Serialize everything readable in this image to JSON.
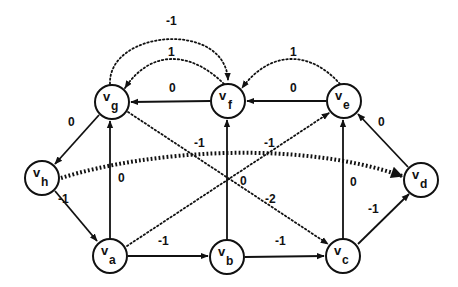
{
  "diagram": {
    "type": "directed-weighted-graph",
    "nodes": [
      {
        "id": "g",
        "label": "v",
        "sub": "g",
        "x": 112,
        "y": 102
      },
      {
        "id": "f",
        "label": "v",
        "sub": "f",
        "x": 228,
        "y": 101
      },
      {
        "id": "e",
        "label": "v",
        "sub": "e",
        "x": 344,
        "y": 101
      },
      {
        "id": "h",
        "label": "v",
        "sub": "h",
        "x": 42,
        "y": 178
      },
      {
        "id": "d",
        "label": "v",
        "sub": "d",
        "x": 421,
        "y": 180
      },
      {
        "id": "a",
        "label": "v",
        "sub": "a",
        "x": 110,
        "y": 256
      },
      {
        "id": "b",
        "label": "v",
        "sub": "b",
        "x": 227,
        "y": 257
      },
      {
        "id": "c",
        "label": "v",
        "sub": "c",
        "x": 343,
        "y": 256
      }
    ],
    "edges": [
      {
        "from": "f",
        "to": "g",
        "weight": "0",
        "style": "solid"
      },
      {
        "from": "e",
        "to": "f",
        "weight": "0",
        "style": "solid"
      },
      {
        "from": "d",
        "to": "e",
        "weight": "0",
        "style": "solid"
      },
      {
        "from": "g",
        "to": "h",
        "weight": "0",
        "style": "solid"
      },
      {
        "from": "h",
        "to": "a",
        "weight": "-1",
        "style": "solid"
      },
      {
        "from": "a",
        "to": "g",
        "weight": "0",
        "style": "solid"
      },
      {
        "from": "a",
        "to": "b",
        "weight": "-1",
        "style": "solid"
      },
      {
        "from": "b",
        "to": "c",
        "weight": "-1",
        "style": "solid"
      },
      {
        "from": "c",
        "to": "d",
        "weight": "-1",
        "style": "solid"
      },
      {
        "from": "b",
        "to": "f",
        "weight": "0",
        "style": "solid"
      },
      {
        "from": "c",
        "to": "e",
        "weight": "0",
        "style": "solid"
      },
      {
        "from": "g",
        "to": "f",
        "weight": "-1",
        "style": "dotted"
      },
      {
        "from": "f",
        "to": "g",
        "weight": "1",
        "style": "dotted"
      },
      {
        "from": "e",
        "to": "f",
        "weight": "1",
        "style": "dotted"
      },
      {
        "from": "g",
        "to": "c",
        "weight": "-2",
        "style": "dotted"
      },
      {
        "from": "a",
        "to": "e",
        "weight": "-1",
        "style": "dotted"
      },
      {
        "from": "h",
        "to": "d",
        "weight": "-1",
        "style": "thick-dotted"
      }
    ],
    "labels": {
      "gf_top": "-1",
      "fg_arc": "1",
      "ef_arc": "1",
      "fg": "0",
      "ef": "0",
      "de": "0",
      "gh": "0",
      "ha": "-1",
      "ag": "0",
      "gc_upper": "-1",
      "ae": "-1",
      "bf": "0",
      "gc": "-2",
      "ce": "0",
      "ab": "-1",
      "bc": "-1",
      "cd": "-1"
    },
    "node_text": {
      "g": {
        "main": "v",
        "sub": "g"
      },
      "f": {
        "main": "v",
        "sub": "f"
      },
      "e": {
        "main": "v",
        "sub": "e"
      },
      "h": {
        "main": "v",
        "sub": "h"
      },
      "d": {
        "main": "v",
        "sub": "d"
      },
      "a": {
        "main": "v",
        "sub": "a"
      },
      "b": {
        "main": "v",
        "sub": "b"
      },
      "c": {
        "main": "v",
        "sub": "c"
      }
    }
  }
}
